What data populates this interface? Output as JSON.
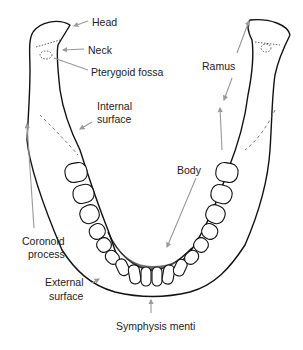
{
  "diagram": {
    "colors": {
      "outline": "#111111",
      "arrow": "#9a9a9a",
      "label": "#222222",
      "background": "#ffffff",
      "shading": "#555555"
    },
    "labels": [
      {
        "id": "head",
        "text": "Head",
        "x": 92,
        "y": 16
      },
      {
        "id": "neck",
        "text": "Neck",
        "x": 88,
        "y": 44
      },
      {
        "id": "pterygoid-fossa",
        "text": "Pterygoid fossa",
        "x": 91,
        "y": 66
      },
      {
        "id": "internal-surface-1",
        "text": "Internal",
        "x": 97,
        "y": 100
      },
      {
        "id": "internal-surface-2",
        "text": "surface",
        "x": 97,
        "y": 113
      },
      {
        "id": "ramus",
        "text": "Ramus",
        "x": 202,
        "y": 60
      },
      {
        "id": "body",
        "text": "Body",
        "x": 177,
        "y": 164
      },
      {
        "id": "coronoid-process-1",
        "text": "Coronoid",
        "x": 22,
        "y": 235
      },
      {
        "id": "coronoid-process-2",
        "text": "process",
        "x": 28,
        "y": 248
      },
      {
        "id": "external-surface-1",
        "text": "External",
        "x": 45,
        "y": 276
      },
      {
        "id": "external-surface-2",
        "text": "surface",
        "x": 49,
        "y": 290
      },
      {
        "id": "symphysis-menti",
        "text": "Symphysis menti",
        "x": 116,
        "y": 320
      }
    ]
  }
}
